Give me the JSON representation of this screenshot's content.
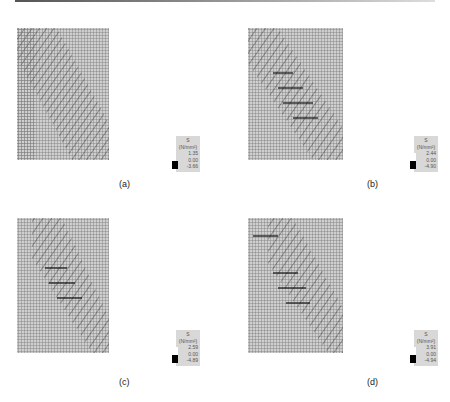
{
  "figure": {
    "panels": [
      {
        "id": "a",
        "caption": "(a)",
        "legend": {
          "quantity": "S",
          "unit": "(N/mm²)",
          "max": "1.35",
          "zero": "0.00",
          "min": "-3.66"
        }
      },
      {
        "id": "b",
        "caption": "(b)",
        "legend": {
          "quantity": "S",
          "unit": "(N/mm²)",
          "max": "2.44",
          "zero": "0.00",
          "min": "-4.90"
        }
      },
      {
        "id": "c",
        "caption": "(c)",
        "legend": {
          "quantity": "S",
          "unit": "(N/mm²)",
          "max": "2.59",
          "zero": "0.00",
          "min": "-4.89"
        }
      },
      {
        "id": "d",
        "caption": "(d)",
        "legend": {
          "quantity": "S",
          "unit": "(N/mm²)",
          "max": "3.91",
          "zero": "0.00",
          "min": "-4.94"
        }
      }
    ]
  }
}
